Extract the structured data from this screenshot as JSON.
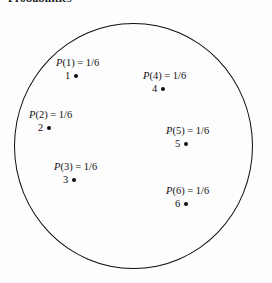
{
  "figure": {
    "title": "Probabilities",
    "shape": "circle",
    "shape_name": "sample-space-circle",
    "background_color": "#fdfdfd",
    "stroke_color": "#0d0d0d",
    "text_color": "#111111"
  },
  "chart_data": {
    "type": "diagram",
    "title": "Probabilities",
    "subtitle": "",
    "xlabel": "",
    "ylabel": "",
    "legend": [],
    "grid": false,
    "categories": [
      "1",
      "2",
      "3",
      "4",
      "5",
      "6"
    ],
    "values": [
      0.1667,
      0.1667,
      0.1667,
      0.1667,
      0.1667,
      0.1667
    ],
    "value_labels": [
      "1/6",
      "1/6",
      "1/6",
      "1/6",
      "1/6",
      "1/6"
    ],
    "points": [
      {
        "id": "1",
        "prob_prefix": "P",
        "prob_arg": "(1)",
        "prob_equals": " = ",
        "prob_value": "1/6",
        "prob_text": "P(1) = 1/6",
        "point_label": "1",
        "dot": "filled-dot",
        "x": 0.26,
        "y": 0.21
      },
      {
        "id": "2",
        "prob_prefix": "P",
        "prob_arg": "(2)",
        "prob_equals": " = ",
        "prob_value": "1/6",
        "prob_text": "P(2) = 1/6",
        "point_label": "2",
        "dot": "filled-dot",
        "x": 0.15,
        "y": 0.44
      },
      {
        "id": "3",
        "prob_prefix": "P",
        "prob_arg": "(3)",
        "prob_equals": " = ",
        "prob_value": "1/6",
        "prob_text": "P(3) = 1/6",
        "point_label": "3",
        "dot": "filled-dot",
        "x": 0.26,
        "y": 0.68
      },
      {
        "id": "4",
        "prob_prefix": "P",
        "prob_arg": "(4)",
        "prob_equals": " = ",
        "prob_value": "1/6",
        "prob_text": "P(4) = 1/6",
        "point_label": "4",
        "dot": "filled-dot",
        "x": 0.62,
        "y": 0.27
      },
      {
        "id": "5",
        "prob_prefix": "P",
        "prob_arg": "(5)",
        "prob_equals": " = ",
        "prob_value": "1/6",
        "prob_text": "P(5) = 1/6",
        "point_label": "5",
        "dot": "filled-dot",
        "x": 0.72,
        "y": 0.52
      },
      {
        "id": "6",
        "prob_prefix": "P",
        "prob_arg": "(6)",
        "prob_equals": " = ",
        "prob_value": "1/6",
        "prob_text": "P(6) = 1/6",
        "point_label": "6",
        "dot": "filled-dot",
        "x": 0.72,
        "y": 0.78
      }
    ]
  }
}
